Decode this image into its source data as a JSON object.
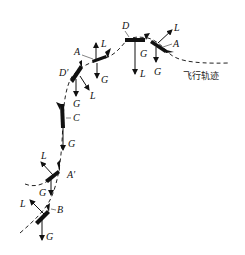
{
  "diagram": {
    "title": "",
    "trajectory_label": "飞行轨迹",
    "points": [
      {
        "id": "B",
        "label": "B"
      },
      {
        "id": "A_prime",
        "label": "A′"
      },
      {
        "id": "C",
        "label": "C"
      },
      {
        "id": "D_prime",
        "label": "D′"
      },
      {
        "id": "A_upper",
        "label": "A"
      },
      {
        "id": "D",
        "label": "D"
      },
      {
        "id": "A_right",
        "label": "A"
      }
    ],
    "forces": {
      "lift": "L",
      "gravity": "G"
    }
  }
}
